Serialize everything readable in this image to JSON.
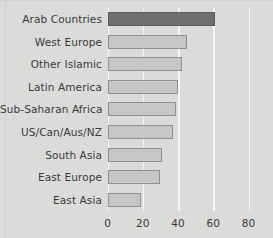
{
  "chart_data": {
    "type": "bar",
    "orientation": "horizontal",
    "title": "",
    "subtitle": "",
    "xlabel": "",
    "ylabel": "",
    "xlim": [
      0,
      80
    ],
    "xticks": [
      0,
      20,
      40,
      60,
      80
    ],
    "xtick_labels": [
      "0",
      "20",
      "40",
      "60",
      "80"
    ],
    "grid": true,
    "grid_axis": "x",
    "grid_color": "#f6f6f5",
    "legend": false,
    "legend_position": "none",
    "background_color": "#dbdbda",
    "bar_color": "#c6c6c5",
    "bar_border_color": "#8f8f8f",
    "highlight_color": "#6f6f6f",
    "highlight_border_color": "#5a5a5a",
    "highlighted_category": "Arab Countries",
    "categories": [
      "Arab Countries",
      "West Europe",
      "Other Islamic",
      "Latin America",
      "Sub-Saharan Africa",
      "US/Can/Aus/NZ",
      "South Asia",
      "East Europe",
      "East Asia"
    ],
    "values": [
      61,
      45,
      42,
      40,
      39,
      37,
      31,
      30,
      19
    ],
    "bars": [
      {
        "label": "Arab Countries",
        "value": 61,
        "highlight": true
      },
      {
        "label": "West Europe",
        "value": 45,
        "highlight": false
      },
      {
        "label": "Other Islamic",
        "value": 42,
        "highlight": false
      },
      {
        "label": "Latin America",
        "value": 40,
        "highlight": false
      },
      {
        "label": "Sub-Saharan Africa",
        "value": 39,
        "highlight": false
      },
      {
        "label": "US/Can/Aus/NZ",
        "value": 37,
        "highlight": false
      },
      {
        "label": "South Asia",
        "value": 31,
        "highlight": false
      },
      {
        "label": "East Europe",
        "value": 30,
        "highlight": false
      },
      {
        "label": "East Asia",
        "value": 19,
        "highlight": false
      }
    ]
  }
}
